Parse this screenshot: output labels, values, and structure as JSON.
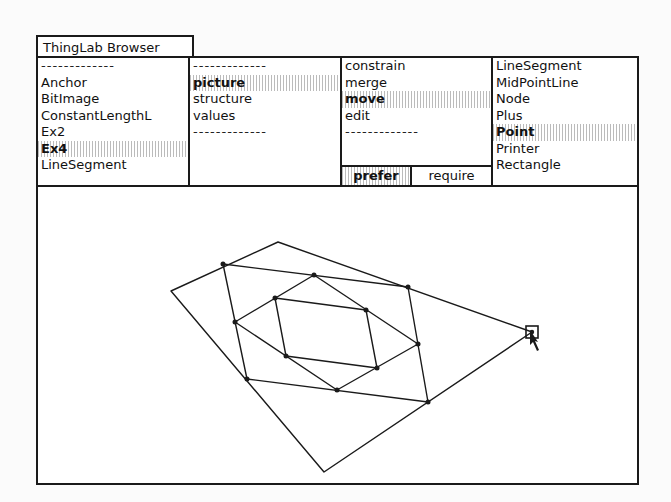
{
  "window": {
    "title": "ThingLab Browser"
  },
  "panes": {
    "classes": {
      "items": [
        {
          "label": "-------------",
          "kind": "separator"
        },
        {
          "label": "Anchor"
        },
        {
          "label": "BitImage"
        },
        {
          "label": "ConstantLengthL"
        },
        {
          "label": "Ex2"
        },
        {
          "label": "Ex4",
          "selected": true
        },
        {
          "label": "LineSegment"
        }
      ]
    },
    "aspects": {
      "items": [
        {
          "label": "-------------",
          "kind": "separator"
        },
        {
          "label": "picture",
          "selected": true
        },
        {
          "label": "structure"
        },
        {
          "label": "values"
        },
        {
          "label": "-------------",
          "kind": "separator"
        }
      ]
    },
    "operations": {
      "items": [
        {
          "label": "constrain"
        },
        {
          "label": "merge"
        },
        {
          "label": "move",
          "selected": true
        },
        {
          "label": "edit"
        },
        {
          "label": "-------------",
          "kind": "separator"
        }
      ],
      "mode_buttons": {
        "prefer": "prefer",
        "require": "require",
        "selected": "prefer"
      }
    },
    "parts": {
      "items": [
        {
          "label": "LineSegment"
        },
        {
          "label": "MidPointLine"
        },
        {
          "label": "Node"
        },
        {
          "label": "Plus"
        },
        {
          "label": "Point",
          "selected": true
        },
        {
          "label": "Printer"
        },
        {
          "label": "Rectangle"
        }
      ]
    }
  },
  "canvas": {
    "description": "Ex4 picture: quadrilateral with nested midpoint quadrilaterals; one vertex being moved",
    "outer_quad": [
      [
        240,
        55
      ],
      [
        498,
        147
      ],
      [
        286,
        285
      ],
      [
        133,
        104
      ]
    ],
    "mid_quad": [
      [
        185,
        77
      ],
      [
        370,
        100
      ],
      [
        390,
        215
      ],
      [
        209,
        192
      ]
    ],
    "inner_quad": [
      [
        276,
        88
      ],
      [
        339,
        181
      ],
      [
        299,
        203
      ],
      [
        197,
        135
      ]
    ],
    "inner_most_quad": [
      [
        248,
        140
      ],
      [
        268,
        94
      ],
      [
        336,
        103
      ],
      [
        339,
        181
      ]
    ],
    "nodes": [
      [
        185,
        77
      ],
      [
        276,
        88
      ],
      [
        370,
        100
      ],
      [
        339,
        181
      ],
      [
        390,
        215
      ],
      [
        299,
        203
      ],
      [
        209,
        192
      ],
      [
        197,
        135
      ],
      [
        248,
        140
      ]
    ],
    "selected_point": [
      494,
      145
    ],
    "colors": {
      "line": "#1a1a1a",
      "background": "#ffffff"
    }
  }
}
